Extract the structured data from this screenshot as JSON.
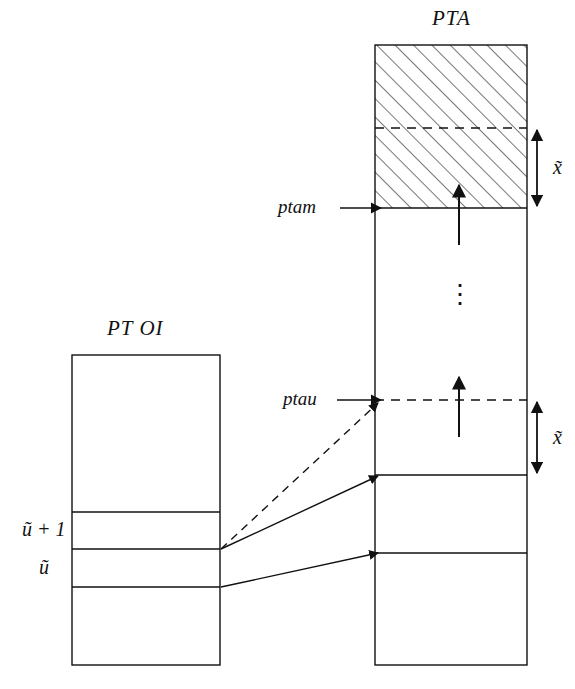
{
  "figure": {
    "type": "diagram",
    "background_color": "#ffffff",
    "line_color": "#111111",
    "hatch_color": "#555555"
  },
  "titles": {
    "pta": "PTA",
    "ptoi": "PT OI"
  },
  "pointers": {
    "ptam": "ptam",
    "ptau": "ptau"
  },
  "measures": {
    "upper_x": "x̃",
    "lower_x": "x̃"
  },
  "ptoi_rows": {
    "u_plus_1": "ũ + 1",
    "u": "ũ"
  },
  "ellipsis": "⋮",
  "geometry": {
    "pta_box": {
      "x": 375,
      "y": 45,
      "width": 152,
      "height": 620
    },
    "pta_hatch": {
      "x": 375,
      "y": 45,
      "width": 152,
      "height": 163
    },
    "pta_dashed_divider_y": 128,
    "pta_ptam_line_y": 208,
    "pta_ptau_line_y": 400,
    "pta_row_line_1_y": 475,
    "pta_row_line_2_y": 553,
    "ptoi_box": {
      "x": 72,
      "y": 355,
      "width": 148,
      "height": 310
    },
    "ptoi_line_1_y": 512,
    "ptoi_line_2_y": 549,
    "ptoi_line_3_y": 587,
    "measure_arrow_x": 537,
    "upper_measure": {
      "y1": 128,
      "y2": 208
    },
    "lower_measure": {
      "y1": 400,
      "y2": 475
    }
  }
}
